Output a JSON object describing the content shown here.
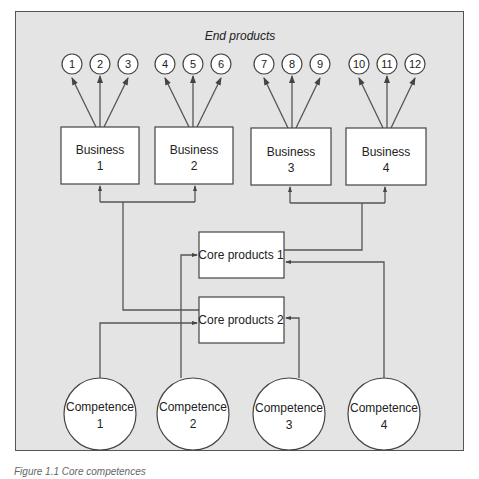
{
  "diagram": {
    "header": "End products",
    "end_products": [
      "1",
      "2",
      "3",
      "4",
      "5",
      "6",
      "7",
      "8",
      "9",
      "10",
      "11",
      "12"
    ],
    "businesses": [
      {
        "line1": "Business",
        "line2": "1"
      },
      {
        "line1": "Business",
        "line2": "2"
      },
      {
        "line1": "Business",
        "line2": "3"
      },
      {
        "line1": "Business",
        "line2": "4"
      }
    ],
    "core_products": [
      "Core products 1",
      "Core products 2"
    ],
    "competences": [
      {
        "line1": "Competence",
        "line2": "1"
      },
      {
        "line1": "Competence",
        "line2": "2"
      },
      {
        "line1": "Competence",
        "line2": "3"
      },
      {
        "line1": "Competence",
        "line2": "4"
      }
    ],
    "caption": "Figure 1.1  Core competences",
    "colors": {
      "background": "#e4e4e4",
      "line": "#555555",
      "node": "#ffffff"
    }
  }
}
